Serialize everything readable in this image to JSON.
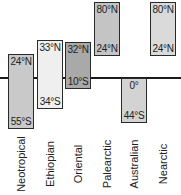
{
  "diagram": {
    "type": "latitude-range-bars",
    "reference_line": "equator",
    "regions": [
      {
        "name": "Neotropical",
        "north": "24°N",
        "south": "55°S",
        "fill": "#c9c9c9"
      },
      {
        "name": "Ethiopian",
        "north": "33°N",
        "south": "34°S",
        "fill": "#efefef"
      },
      {
        "name": "Oriental",
        "north": "32°N",
        "south": "10°S",
        "fill": "#a9a9a9"
      },
      {
        "name": "Palearctic",
        "north": "80°N",
        "south": "24°N",
        "fill": "#c4c4c4"
      },
      {
        "name": "Australian",
        "north": "0°",
        "south": "44°S",
        "fill": "#d3d3d3"
      },
      {
        "name": "Nearctic",
        "north": "80°N",
        "south": "24°N",
        "fill": "#dadada"
      }
    ]
  }
}
